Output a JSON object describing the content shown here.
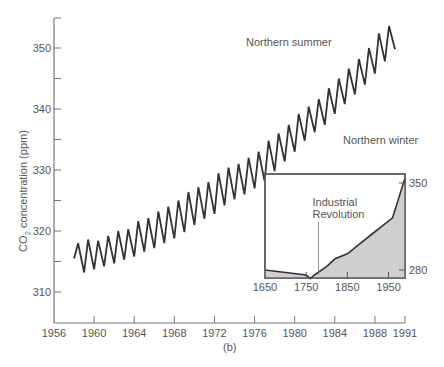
{
  "chart_data": {
    "type": "line",
    "title": "",
    "xlabel": "",
    "ylabel": "CO2 concentration (ppm)",
    "caption": "(b)",
    "xlim": [
      1956,
      1991
    ],
    "ylim": [
      305,
      355
    ],
    "x_ticks": [
      1956,
      1960,
      1964,
      1968,
      1972,
      1976,
      1980,
      1984,
      1988,
      1991
    ],
    "y_ticks": [
      310,
      320,
      330,
      340,
      350
    ],
    "grid": false,
    "annotations": [
      "Northern summer",
      "Northern winter"
    ],
    "series": [
      {
        "name": "Mauna Loa CO2 (seasonal)",
        "x": [
          1958.0,
          1958.4,
          1959.0,
          1959.4,
          1960.0,
          1960.4,
          1961.0,
          1961.4,
          1962.0,
          1962.4,
          1963.0,
          1963.4,
          1964.0,
          1964.4,
          1965.0,
          1965.4,
          1966.0,
          1966.4,
          1967.0,
          1967.4,
          1968.0,
          1968.4,
          1969.0,
          1969.4,
          1970.0,
          1970.4,
          1971.0,
          1971.4,
          1972.0,
          1972.4,
          1973.0,
          1973.4,
          1974.0,
          1974.4,
          1975.0,
          1975.4,
          1976.0,
          1976.4,
          1977.0,
          1977.4,
          1978.0,
          1978.4,
          1979.0,
          1979.4,
          1980.0,
          1980.4,
          1981.0,
          1981.4,
          1982.0,
          1982.4,
          1983.0,
          1983.4,
          1984.0,
          1984.4,
          1985.0,
          1985.4,
          1986.0,
          1986.4,
          1987.0,
          1987.4,
          1988.0,
          1988.4,
          1989.0,
          1989.4,
          1990.0
        ],
        "values": [
          315.5,
          318.0,
          313.2,
          318.6,
          313.7,
          318.4,
          314.2,
          319.2,
          314.7,
          320.0,
          315.3,
          320.3,
          315.8,
          321.6,
          316.6,
          322.1,
          317.2,
          323.2,
          318.0,
          324.0,
          318.8,
          325.0,
          319.8,
          326.4,
          321.0,
          327.2,
          322.0,
          328.0,
          322.8,
          329.5,
          324.2,
          330.4,
          325.2,
          331.0,
          326.0,
          332.0,
          327.0,
          333.0,
          328.2,
          334.8,
          329.8,
          336.0,
          331.4,
          337.4,
          333.0,
          339.2,
          334.8,
          340.4,
          336.2,
          341.6,
          337.4,
          343.4,
          339.2,
          345.0,
          340.8,
          346.6,
          342.4,
          348.2,
          344.0,
          350.0,
          345.8,
          352.4,
          347.8,
          353.6,
          349.8
        ]
      }
    ],
    "inset": {
      "type": "area",
      "xlim": [
        1650,
        1990
      ],
      "x_ticks": [
        1650,
        1750,
        1850,
        1950
      ],
      "y_ticks": [
        280,
        350
      ],
      "annotation": "Industrial Revolution",
      "annotation_x": 1780,
      "x": [
        1650,
        1750,
        1760,
        1770,
        1800,
        1820,
        1850,
        1880,
        1910,
        1960,
        1990
      ],
      "values": [
        280,
        276,
        273,
        276,
        283,
        289,
        293,
        301,
        309,
        322,
        354
      ]
    }
  },
  "labels": {
    "ylabel_prefix": "CO",
    "ylabel_sub": "2",
    "ylabel_suffix": " concentration (ppm)",
    "summer": "Northern summer",
    "winter": "Northern winter",
    "industrial_line1": "Industrial",
    "industrial_line2": "Revolution",
    "caption": "(b)"
  }
}
